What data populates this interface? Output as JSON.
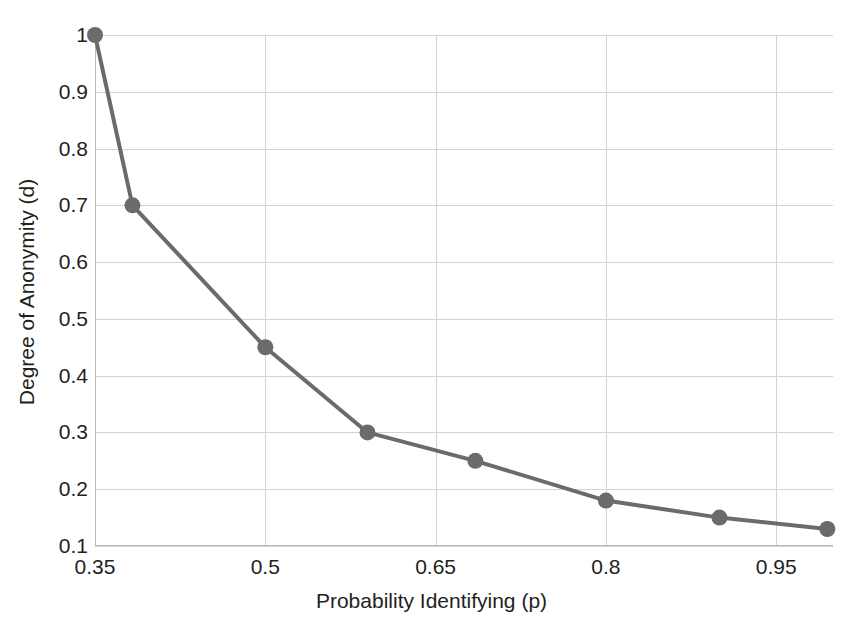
{
  "chart_data": {
    "type": "line",
    "title": "",
    "xlabel": "Probability Identifying (p)",
    "ylabel": "Degree of Anonymity (d)",
    "xlim": [
      0.35,
      1.0
    ],
    "ylim": [
      0.1,
      1.0
    ],
    "grid": true,
    "legend": "none",
    "marker": "circle",
    "line_color": "#6b6b6b",
    "marker_color": "#6b6b6b",
    "grid_color": "#d3d3d3",
    "xticks": [
      "0.35",
      "0.5",
      "0.65",
      "0.8",
      "0.95"
    ],
    "xtick_values": [
      0.35,
      0.5,
      0.65,
      0.8,
      0.95
    ],
    "yticks": [
      "1",
      "0.9",
      "0.8",
      "0.7",
      "0.6",
      "0.5",
      "0.4",
      "0.3",
      "0.2",
      "0.1"
    ],
    "ytick_values": [
      1.0,
      0.9,
      0.8,
      0.7,
      0.6,
      0.5,
      0.4,
      0.3,
      0.2,
      0.1
    ],
    "series": [
      {
        "name": "Degree of Anonymity",
        "x": [
          0.35,
          0.383,
          0.5,
          0.59,
          0.685,
          0.8,
          0.9,
          0.995
        ],
        "y": [
          1.0,
          0.7,
          0.45,
          0.3,
          0.25,
          0.18,
          0.15,
          0.13
        ]
      }
    ]
  }
}
